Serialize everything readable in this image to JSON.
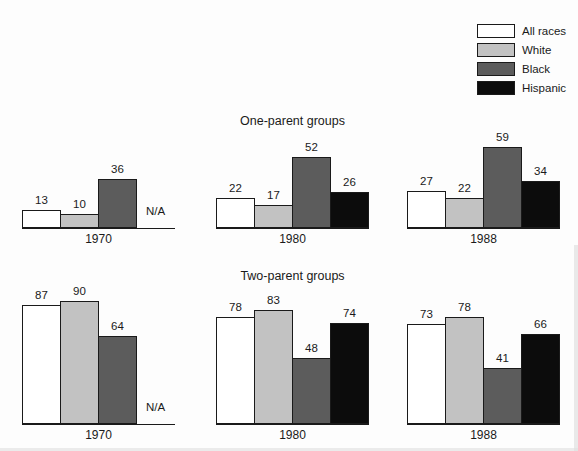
{
  "figure": {
    "background": "#fdfdfd",
    "text_color": "#1a1a1a",
    "axis_color": "#1a1a1a"
  },
  "legend": {
    "position": "top-right",
    "items": [
      {
        "label": "All races",
        "color": "#ffffff"
      },
      {
        "label": "White",
        "color": "#c2c2c2"
      },
      {
        "label": "Black",
        "color": "#5c5c5c"
      },
      {
        "label": "Hispanic",
        "color": "#0c0c0c"
      }
    ]
  },
  "chart_data": [
    {
      "type": "bar",
      "title": "One-parent groups",
      "categories": [
        "1970",
        "1980",
        "1988"
      ],
      "series": [
        {
          "name": "All races",
          "color": "#ffffff",
          "values": [
            13,
            22,
            27
          ]
        },
        {
          "name": "White",
          "color": "#c2c2c2",
          "values": [
            10,
            17,
            22
          ]
        },
        {
          "name": "Black",
          "color": "#5c5c5c",
          "values": [
            36,
            52,
            59
          ]
        },
        {
          "name": "Hispanic",
          "color": "#0c0c0c",
          "values": [
            null,
            26,
            34
          ]
        }
      ],
      "missing_value_label": "N/A",
      "value_labels": true,
      "ylim": [
        0,
        100
      ],
      "grid": false,
      "legend_position": "top-right"
    },
    {
      "type": "bar",
      "title": "Two-parent groups",
      "categories": [
        "1970",
        "1980",
        "1988"
      ],
      "series": [
        {
          "name": "All races",
          "color": "#ffffff",
          "values": [
            87,
            78,
            73
          ]
        },
        {
          "name": "White",
          "color": "#c2c2c2",
          "values": [
            90,
            83,
            78
          ]
        },
        {
          "name": "Black",
          "color": "#5c5c5c",
          "values": [
            64,
            48,
            41
          ]
        },
        {
          "name": "Hispanic",
          "color": "#0c0c0c",
          "values": [
            null,
            74,
            66
          ]
        }
      ],
      "missing_value_label": "N/A",
      "value_labels": true,
      "ylim": [
        0,
        100
      ],
      "grid": false
    }
  ]
}
